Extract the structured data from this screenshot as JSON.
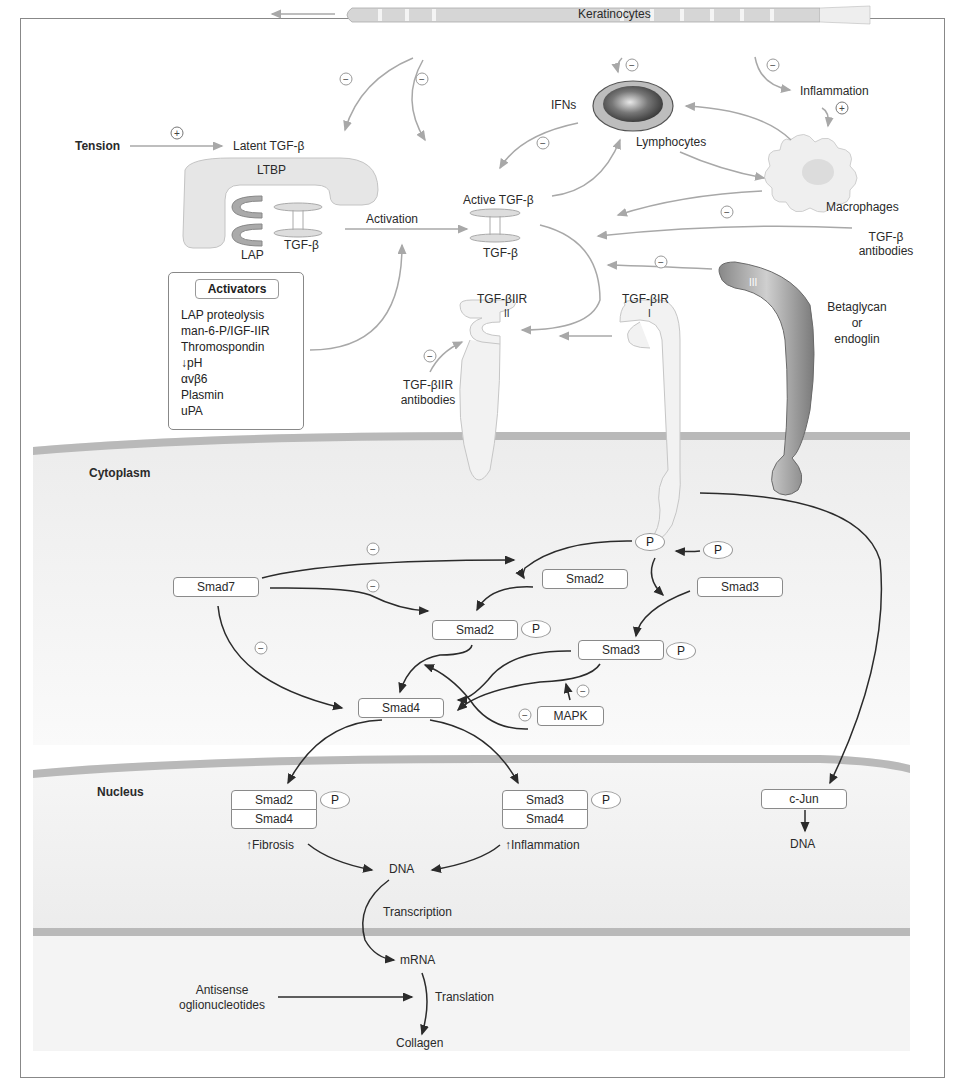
{
  "figure": {
    "colors": {
      "membrane_band": "#b9b9b9",
      "compartment_fill": "#f1f1f1",
      "extracellular_arrow": "#a8a8a8",
      "intracellular_arrow": "#2b2b2b",
      "receptor_fill": "#f2f2f2",
      "betaglycan_fill": "#9a9a9a",
      "text": "#2a2a2a"
    }
  },
  "extracellular": {
    "keratinocytes": "Keratinocytes",
    "lymphocytes": "Lymphocytes",
    "ifns": "IFNs",
    "inflammation": "Inflammation",
    "macrophages": "Macrophages",
    "tension": "Tension",
    "latent_tgfb": "Latent TGF-β",
    "ltbp": "LTBP",
    "lap": "LAP",
    "tgfb_latent": "TGF-β",
    "activation": "Activation",
    "active_tgfb": "Active TGF-β",
    "tgfb_active": "TGF-β",
    "tgfb_antibodies_line1": "TGF-β",
    "tgfb_antibodies_line2": "antibodies",
    "tgfbiir_antibodies_line1": "TGF-βIIR",
    "tgfbiir_antibodies_line2": "antibodies",
    "betaglycan_line1": "Betaglycan",
    "betaglycan_line2": "or",
    "betaglycan_line3": "endoglin"
  },
  "receptors": {
    "type2_label": "TGF-βIIR",
    "type2_numeral": "II",
    "type1_label": "TGF-βIR",
    "type1_numeral": "I",
    "type3_numeral": "III"
  },
  "activators": {
    "title": "Activators",
    "items": [
      "LAP proteolysis",
      "man-6-P/IGF-IIR",
      "Thromospondin",
      "↓pH",
      "αvβ6",
      "Plasmin",
      "uPA"
    ]
  },
  "signs": {
    "minus": "−",
    "plus": "+"
  },
  "cytoplasm": {
    "label": "Cytoplasm",
    "smad7": "Smad7",
    "smad2": "Smad2",
    "smad3": "Smad3",
    "smad2p": "Smad2",
    "smad3p": "Smad3",
    "smad4": "Smad4",
    "mapk": "MAPK",
    "phospho": "P"
  },
  "nucleus": {
    "label": "Nucleus",
    "complex1_top": "Smad2",
    "complex1_bottom": "Smad4",
    "complex2_top": "Smad3",
    "complex2_bottom": "Smad4",
    "cjun": "c-Jun",
    "dna_main": "DNA",
    "dna_cjun": "DNA",
    "fibrosis": "↑Fibrosis",
    "inflammation": "↑Inflammation",
    "transcription": "Transcription",
    "phospho": "P"
  },
  "translation": {
    "mrna": "mRNA",
    "translation": "Translation",
    "collagen": "Collagen",
    "antisense_line1": "Antisense",
    "antisense_line2": "oglionucleotides"
  }
}
